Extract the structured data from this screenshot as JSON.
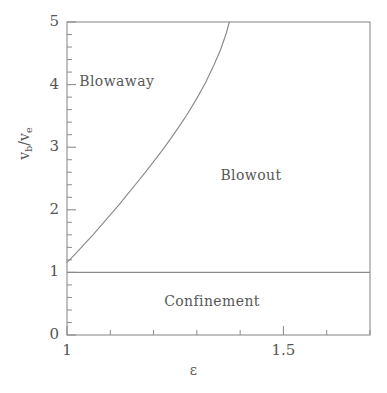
{
  "chart_data": {
    "type": "line",
    "title": "",
    "subtitle": "",
    "xlabel": "ε",
    "ylabel": "v_b/v_e",
    "ylabel_parts": {
      "num_base": "v",
      "num_sub": "b",
      "slash": "/",
      "den_base": "v",
      "den_sub": "e"
    },
    "xlim": [
      1.0,
      1.7
    ],
    "ylim": [
      0,
      5
    ],
    "grid": false,
    "legend": null,
    "x_major_ticks": [
      1.0,
      1.5
    ],
    "x_major_tick_labels": [
      "1",
      "1.5"
    ],
    "x_minor_ticks": [
      1.1,
      1.2,
      1.3,
      1.4,
      1.6,
      1.7
    ],
    "y_major_ticks": [
      0,
      1,
      2,
      3,
      4,
      5
    ],
    "y_major_tick_labels": [
      "0",
      "1",
      "2",
      "3",
      "4",
      "5"
    ],
    "y_minor_ticks": [
      0.2,
      0.4,
      0.6,
      0.8,
      1.2,
      1.4,
      1.6,
      1.8,
      2.2,
      2.4,
      2.6,
      2.8,
      3.2,
      3.4,
      3.6,
      3.8,
      4.2,
      4.4,
      4.6,
      4.8
    ],
    "series": [
      {
        "name": "blowaway-blowout-boundary",
        "type": "curve",
        "points": [
          [
            1.0,
            1.16
          ],
          [
            1.02,
            1.3
          ],
          [
            1.04,
            1.45
          ],
          [
            1.06,
            1.6
          ],
          [
            1.08,
            1.76
          ],
          [
            1.1,
            1.92
          ],
          [
            1.12,
            2.08
          ],
          [
            1.14,
            2.25
          ],
          [
            1.16,
            2.42
          ],
          [
            1.18,
            2.59
          ],
          [
            1.2,
            2.77
          ],
          [
            1.22,
            2.95
          ],
          [
            1.24,
            3.14
          ],
          [
            1.26,
            3.34
          ],
          [
            1.28,
            3.55
          ],
          [
            1.3,
            3.78
          ],
          [
            1.32,
            4.03
          ],
          [
            1.34,
            4.32
          ],
          [
            1.355,
            4.56
          ],
          [
            1.368,
            4.82
          ],
          [
            1.375,
            5.0
          ]
        ]
      },
      {
        "name": "confinement-blowout-boundary",
        "type": "horizontal-line",
        "y": 1.0,
        "x_from": 1.0,
        "x_to": 1.7
      }
    ],
    "annotations": [
      {
        "text": "Blowaway",
        "x": 1.115,
        "y": 4.05
      },
      {
        "text": "Blowout",
        "x": 1.425,
        "y": 2.55
      },
      {
        "text": "Confinement",
        "x": 1.335,
        "y": 0.55
      }
    ]
  },
  "style": {
    "line_color": "#8a8a8a",
    "frame_color": "#8c8c8c",
    "text_color": "#585858",
    "background": "#ffffff"
  }
}
